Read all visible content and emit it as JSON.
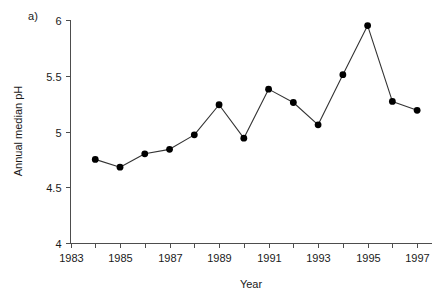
{
  "figure": {
    "panel_label": "a)",
    "background_color": "#ffffff",
    "line_color": "#333333",
    "marker_color": "#000000",
    "axis_color": "#4d4d4d",
    "text_color": "#1a1a1a"
  },
  "chart_data": {
    "type": "line",
    "title": "",
    "subtitle": "",
    "xlabel": "Year",
    "ylabel": "Annual median pH",
    "xlim": [
      1983,
      1997.6
    ],
    "ylim": [
      4,
      6
    ],
    "grid": false,
    "legend": null,
    "legend_position": "none",
    "annotations": [
      "a)"
    ],
    "x_major_ticks": [
      1983,
      1985,
      1987,
      1989,
      1991,
      1993,
      1995,
      1997
    ],
    "x_minor_ticks": [
      1984,
      1986,
      1988,
      1990,
      1992,
      1994,
      1996
    ],
    "x_tick_labels": [
      "1983",
      "1985",
      "1987",
      "1989",
      "1991",
      "1993",
      "1995",
      "1997"
    ],
    "y_ticks": [
      4,
      4.5,
      5,
      5.5,
      6
    ],
    "y_tick_labels": [
      "4",
      "4.5",
      "5",
      "5.5",
      "6"
    ],
    "marker": "filled-circle",
    "x": [
      1984,
      1985,
      1986,
      1987,
      1988,
      1989,
      1990,
      1991,
      1992,
      1993,
      1994,
      1995,
      1996,
      1997
    ],
    "values": [
      4.75,
      4.68,
      4.8,
      4.84,
      4.97,
      5.24,
      4.94,
      5.38,
      5.26,
      5.06,
      5.51,
      5.95,
      5.27,
      5.19
    ],
    "series": [
      {
        "name": "Annual median pH",
        "values": [
          4.75,
          4.68,
          4.8,
          4.84,
          4.97,
          5.24,
          4.94,
          5.38,
          5.26,
          5.06,
          5.51,
          5.95,
          5.27,
          5.19
        ]
      }
    ]
  }
}
